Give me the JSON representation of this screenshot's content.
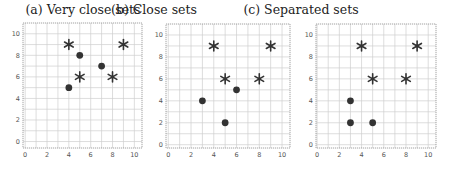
{
  "chart_data": [
    {
      "type": "scatter",
      "title": "(a) Very close sets",
      "xlabel": "",
      "ylabel": "",
      "xlim": [
        -0.2,
        10.7
      ],
      "ylim": [
        -0.6,
        11.0
      ],
      "xticks": [
        0,
        2,
        4,
        6,
        8,
        10
      ],
      "yticks": [
        0,
        2,
        4,
        6,
        8,
        10
      ],
      "grid": true,
      "legend": null,
      "series": [
        {
          "name": "stars",
          "marker": "asterisk",
          "color": "#333333",
          "points": [
            [
              4,
              9
            ],
            [
              9,
              9
            ],
            [
              5,
              6
            ],
            [
              8,
              6
            ]
          ]
        },
        {
          "name": "circles",
          "marker": "circle",
          "color": "#333333",
          "points": [
            [
              5,
              8
            ],
            [
              7,
              7
            ],
            [
              4,
              5
            ]
          ]
        }
      ]
    },
    {
      "type": "scatter",
      "title": "(b) Close sets",
      "xlabel": "",
      "ylabel": "",
      "xlim": [
        -0.2,
        10.7
      ],
      "ylim": [
        -0.3,
        11.0
      ],
      "xticks": [
        0,
        2,
        4,
        6,
        8,
        10
      ],
      "yticks": [
        0,
        2,
        4,
        6,
        8,
        10
      ],
      "grid": true,
      "legend": null,
      "series": [
        {
          "name": "stars",
          "marker": "asterisk",
          "color": "#333333",
          "points": [
            [
              4,
              9
            ],
            [
              9,
              9
            ],
            [
              5,
              6
            ],
            [
              8,
              6
            ]
          ]
        },
        {
          "name": "circles",
          "marker": "circle",
          "color": "#333333",
          "points": [
            [
              6,
              5
            ],
            [
              3,
              4
            ],
            [
              5,
              2
            ]
          ]
        }
      ]
    },
    {
      "type": "scatter",
      "title": "(c) Separated sets",
      "xlabel": "",
      "ylabel": "",
      "xlim": [
        -0.1,
        10.7
      ],
      "ylim": [
        -0.3,
        11.0
      ],
      "xticks": [
        0,
        2,
        4,
        6,
        8,
        10
      ],
      "yticks": [
        0,
        2,
        4,
        6,
        8,
        10
      ],
      "grid": true,
      "legend": null,
      "series": [
        {
          "name": "stars",
          "marker": "asterisk",
          "color": "#333333",
          "points": [
            [
              4,
              9
            ],
            [
              9,
              9
            ],
            [
              5,
              6
            ],
            [
              8,
              6
            ]
          ]
        },
        {
          "name": "circles",
          "marker": "circle",
          "color": "#333333",
          "points": [
            [
              3,
              4
            ],
            [
              3,
              2
            ],
            [
              5,
              2
            ]
          ]
        }
      ]
    }
  ],
  "panels": [
    {
      "title": "(a) Very close sets"
    },
    {
      "title": "(b) Close sets"
    },
    {
      "title": "(c) Separated sets"
    }
  ],
  "colors": {
    "grid": "#cfcfcf",
    "axis": "#8a8a8a",
    "marker": "#333333",
    "tick_label": "#555555"
  }
}
